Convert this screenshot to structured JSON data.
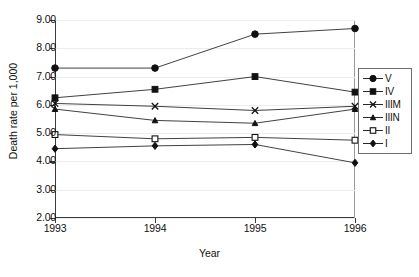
{
  "chart_data": {
    "type": "line",
    "title": "",
    "xlabel": "Year",
    "ylabel": "Death rate per 1,000",
    "categories": [
      "1993",
      "1994",
      "1995",
      "1996"
    ],
    "x": [
      1993,
      1994,
      1995,
      1996
    ],
    "xlim": [
      1993,
      1996
    ],
    "ylim": [
      2.0,
      9.0
    ],
    "ytick_labels": [
      "9.00",
      "8.00",
      "7.00",
      "6.00",
      "5.00",
      "4.00",
      "3.00",
      "2.00"
    ],
    "ytick_values": [
      9.0,
      8.0,
      7.0,
      6.0,
      5.0,
      4.0,
      3.0,
      2.0
    ],
    "grid": true,
    "legend_position": "right",
    "series": [
      {
        "name": "V",
        "marker": "filled-circle",
        "values": [
          7.3,
          7.3,
          8.5,
          8.7
        ]
      },
      {
        "name": "IV",
        "marker": "filled-square",
        "values": [
          6.25,
          6.55,
          7.0,
          6.45
        ]
      },
      {
        "name": "IIIM",
        "marker": "cross-x",
        "values": [
          6.05,
          5.95,
          5.8,
          5.95
        ]
      },
      {
        "name": "IIIN",
        "marker": "filled-triangle",
        "values": [
          5.85,
          5.45,
          5.35,
          5.85
        ]
      },
      {
        "name": "II",
        "marker": "open-square",
        "values": [
          4.95,
          4.8,
          4.85,
          4.75
        ]
      },
      {
        "name": "I",
        "marker": "filled-diamond",
        "values": [
          4.45,
          4.55,
          4.6,
          3.95
        ]
      }
    ]
  },
  "legend": {
    "items": [
      {
        "label": "V"
      },
      {
        "label": "IV"
      },
      {
        "label": "IIIM"
      },
      {
        "label": "IIIN"
      },
      {
        "label": "II"
      },
      {
        "label": "I"
      }
    ]
  },
  "colors": {
    "line": "#2b2b2b",
    "marker": "#111111",
    "grid": "#ededed",
    "axis": "#3b3b3b",
    "background": "#ffffff"
  }
}
